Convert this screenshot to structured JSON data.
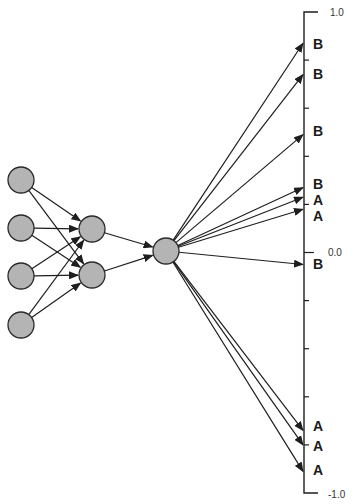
{
  "diagram": {
    "type": "neural-network-output-mapping",
    "node_fill": "#b4b4b4",
    "node_stroke": "#2a2a2a",
    "edge_color": "#1e1e1e",
    "layers": {
      "input": [
        {
          "id": "i1",
          "x": 21,
          "y": 180
        },
        {
          "id": "i2",
          "x": 21,
          "y": 228
        },
        {
          "id": "i3",
          "x": 21,
          "y": 276
        },
        {
          "id": "i4",
          "x": 21,
          "y": 325
        }
      ],
      "hidden": [
        {
          "id": "h1",
          "x": 92,
          "y": 229
        },
        {
          "id": "h2",
          "x": 92,
          "y": 275
        }
      ],
      "output": [
        {
          "id": "o1",
          "x": 166,
          "y": 251
        }
      ]
    },
    "node_radius": 13,
    "connections": [
      [
        "i1",
        "h1"
      ],
      [
        "i1",
        "h2"
      ],
      [
        "i2",
        "h1"
      ],
      [
        "i2",
        "h2"
      ],
      [
        "i3",
        "h1"
      ],
      [
        "i3",
        "h2"
      ],
      [
        "i4",
        "h1"
      ],
      [
        "i4",
        "h2"
      ],
      [
        "h1",
        "o1"
      ],
      [
        "h2",
        "o1"
      ]
    ],
    "axis": {
      "x": 304,
      "top_y": 12,
      "bottom_y": 493,
      "max_label": "1.0",
      "zero_label": "0.0",
      "min_label": "-1.0",
      "max_value": 1.0,
      "min_value": -1.0,
      "tick_step": 0.2
    },
    "outputs": [
      {
        "label": "B",
        "value": 0.87
      },
      {
        "label": "B",
        "value": 0.74
      },
      {
        "label": "B",
        "value": 0.49
      },
      {
        "label": "B",
        "value": 0.27
      },
      {
        "label": "A",
        "value": 0.23
      },
      {
        "label": "A",
        "value": 0.18
      },
      {
        "label": "B",
        "value": -0.05
      },
      {
        "label": "A",
        "value": -0.74
      },
      {
        "label": "A",
        "value": -0.8
      },
      {
        "label": "A",
        "value": -0.91
      }
    ],
    "label_positions": [
      {
        "label": "B",
        "y": 44
      },
      {
        "label": "B",
        "y": 74
      },
      {
        "label": "B",
        "y": 131
      },
      {
        "label": "B",
        "y": 184
      },
      {
        "label": "A",
        "y": 200
      },
      {
        "label": "A",
        "y": 216
      },
      {
        "label": "B",
        "y": 264
      },
      {
        "label": "A",
        "y": 426
      },
      {
        "label": "A",
        "y": 446
      },
      {
        "label": "A",
        "y": 470
      }
    ]
  }
}
